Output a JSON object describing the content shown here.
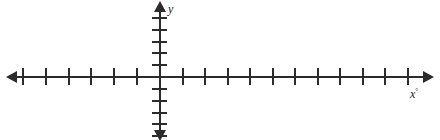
{
  "figure": {
    "background_color": "#ffffff",
    "stroke_color": "#2b2b2b",
    "width": 440,
    "height": 140
  },
  "labels": {
    "y_axis": "y",
    "x_axis": "x",
    "x_axis_mark": "°"
  },
  "chart_data": {
    "type": "line",
    "title": "",
    "subtitle": "",
    "xlabel": "x",
    "ylabel": "y",
    "grid": false,
    "legend": [],
    "series": [],
    "x": [],
    "values": [],
    "annotations": [],
    "axes": {
      "x_axis": {
        "origin_px": 160,
        "axis_y_px": 77,
        "line_start_px": 14,
        "line_end_px": 426,
        "tick_spacing_px": 22.6,
        "tick_length_px": 17,
        "ticks_left_of_origin": 6,
        "ticks_right_of_origin": 11,
        "tick_positions_px": [
          23,
          46,
          69,
          91,
          114,
          137,
          183,
          205,
          228,
          250,
          273,
          295,
          318,
          340,
          363,
          385,
          408
        ],
        "tick_labels": [],
        "arrow_start": true,
        "arrow_end": true,
        "xlim": [
          -7,
          12
        ]
      },
      "y_axis": {
        "origin_px": 77,
        "axis_x_px": 160,
        "line_start_px": 6,
        "line_end_px": 137,
        "tick_spacing_px": 11.7,
        "tick_length_px": 15,
        "ticks_above_origin": 5,
        "ticks_below_origin": 5,
        "tick_positions_px": [
          18,
          30,
          42,
          53,
          65,
          89,
          101,
          113,
          124,
          136
        ],
        "tick_labels": [],
        "arrow_start": true,
        "arrow_end": true,
        "ylim": [
          -6,
          6
        ]
      }
    }
  }
}
